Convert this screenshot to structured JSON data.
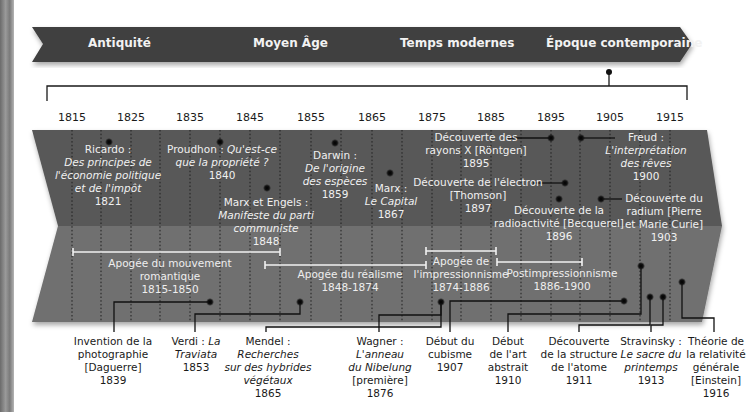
{
  "eras": [
    {
      "label": "Antiquité",
      "x": 88
    },
    {
      "label": "Moyen Âge",
      "x": 253
    },
    {
      "label": "Temps modernes",
      "x": 400
    },
    {
      "label": "Époque contemporaine",
      "x": 546
    }
  ],
  "years": [
    {
      "label": "1815",
      "x": 72
    },
    {
      "label": "1825",
      "x": 131
    },
    {
      "label": "1835",
      "x": 190
    },
    {
      "label": "1845",
      "x": 250
    },
    {
      "label": "1855",
      "x": 311
    },
    {
      "label": "1865",
      "x": 372
    },
    {
      "label": "1875",
      "x": 432
    },
    {
      "label": "1885",
      "x": 491
    },
    {
      "label": "1895",
      "x": 551
    },
    {
      "label": "1905",
      "x": 610
    },
    {
      "label": "1915",
      "x": 670
    }
  ],
  "events_top": [
    {
      "id": "ricardo",
      "name": "Ricardo :",
      "title": [
        "Des principes de",
        "l'économie politique",
        "et de l'impôt"
      ],
      "year": "1821",
      "x": 108,
      "y": 144
    },
    {
      "id": "proudhon",
      "name": "Proudhon :",
      "title_inline": "Qu'est-ce",
      "title": [
        "que la propriété ?"
      ],
      "year": "1840",
      "x": 218,
      "y": 144
    },
    {
      "id": "marx-engels",
      "name": "Marx et Engels :",
      "title": [
        "Manifeste du parti",
        "communiste"
      ],
      "year": "1848",
      "x": 266,
      "y": 202
    },
    {
      "id": "darwin",
      "name": "Darwin :",
      "title": [
        "De l'origine",
        "des espèces"
      ],
      "year": "1859",
      "x": 333,
      "y": 148
    },
    {
      "id": "marx-capital",
      "name": "Marx :",
      "title": [
        "Le Capital"
      ],
      "year": "1867",
      "x": 390,
      "y": 177
    },
    {
      "id": "rontgen",
      "label": [
        "Découverte des",
        "rayons X [Röntgen]"
      ],
      "year": "1895",
      "x": 478,
      "y": 132
    },
    {
      "id": "thomson",
      "label": [
        "Découverte de l'électron",
        "[Thomson]"
      ],
      "year": "1897",
      "x": 478,
      "y": 178
    },
    {
      "id": "becquerel",
      "label": [
        "Découverte de la",
        "radioactivité [Becquerel]"
      ],
      "year": "1896",
      "x": 558,
      "y": 208
    },
    {
      "id": "freud",
      "name": "Freud :",
      "title": [
        "L'interprétation",
        "des rêves"
      ],
      "year": "1900",
      "x": 643,
      "y": 132
    },
    {
      "id": "curie",
      "label": [
        "Découverte du",
        "radium [Pierre",
        "et Marie Curie]"
      ],
      "year": "1903",
      "x": 663,
      "y": 193
    }
  ],
  "periods": [
    {
      "label": "Apogée du mouvement",
      "label2": "romantique",
      "years": "1815-1850",
      "x": 170,
      "y": 258,
      "bar": [
        73,
        280,
        248
      ]
    },
    {
      "label": "Apogée du réalisme",
      "years": "1848-1874",
      "x": 350,
      "y": 269,
      "bar": [
        265,
        426,
        262
      ]
    },
    {
      "label": "Apogée de",
      "label2": "l'impressionnisme",
      "years": "1874-1886",
      "x": 462,
      "y": 255,
      "bar": [
        426,
        496,
        252
      ]
    },
    {
      "label": "Postimpressionnisme",
      "years": "1886-1900",
      "x": 560,
      "y": 268,
      "bar": [
        497,
        582,
        262
      ]
    }
  ],
  "events_bottom": [
    {
      "id": "daguerre",
      "lines": [
        "Invention de la",
        "photographie",
        "[Daguerre]"
      ],
      "italic": [],
      "year": "1839",
      "x": 113
    },
    {
      "id": "verdi",
      "lines": [
        "Verdi :",
        "La Traviata"
      ],
      "italic_from": 1,
      "year": "1853",
      "x": 196,
      "raw": [
        "Verdi : <i>La</i>",
        "<i>Traviata</i>"
      ]
    },
    {
      "id": "mendel",
      "lines": [
        "Mendel :",
        "Recherches",
        "sur des hybrides",
        "végétaux"
      ],
      "year": "1865",
      "x": 270
    },
    {
      "id": "wagner",
      "lines": [
        "Wagner :",
        "L'anneau",
        "du Nibelung",
        "[première]"
      ],
      "year": "1876",
      "x": 381
    },
    {
      "id": "cubisme",
      "lines": [
        "Début du",
        "cubisme"
      ],
      "year": "1907",
      "x": 448
    },
    {
      "id": "art-abstrait",
      "lines": [
        "Début",
        "de l'art",
        "abstrait"
      ],
      "year": "1910",
      "x": 506
    },
    {
      "id": "atome",
      "lines": [
        "Découverte",
        "de la structure",
        "de l'atome"
      ],
      "year": "1911",
      "x": 577
    },
    {
      "id": "stravinsky",
      "lines": [
        "Stravinsky :",
        "Le sacre du",
        "printemps"
      ],
      "year": "1913",
      "x": 651
    },
    {
      "id": "einstein",
      "lines": [
        "Théorie de",
        "la relativité",
        "générale",
        "[Einstein]"
      ],
      "year": "1916",
      "x": 716
    }
  ],
  "colors": {
    "ribbon": "#3f3f3f",
    "band_top": "#595959",
    "band_bottom": "#6f6f6f",
    "text_light": "#f0f0f0",
    "text_dark": "#1a1a1a"
  }
}
